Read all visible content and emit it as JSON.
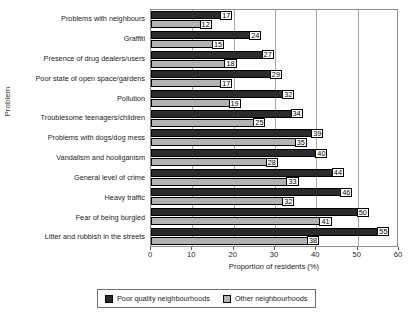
{
  "chart_data": {
    "type": "bar",
    "orientation": "horizontal",
    "title": "",
    "xlabel": "Proportion of residents (%)",
    "ylabel": "Problem",
    "xlim": [
      0,
      60
    ],
    "xticks": [
      0,
      10,
      20,
      30,
      40,
      50,
      60
    ],
    "grid": true,
    "grid_axis": "x",
    "legend_position": "bottom",
    "data_labels": true,
    "categories": [
      "Problems with neighbours",
      "Graffiti",
      "Presence of drug dealers/users",
      "Poor state of open space/gardens",
      "Pollution",
      "Troublesome teenagers/children",
      "Problems with dogs/dog mess",
      "Vandalism and hooliganism",
      "General level of crime",
      "Heavy traffic",
      "Fear of being burgled",
      "Litter and rubbish in the streets"
    ],
    "series": [
      {
        "name": "Poor quality neighbourhoods",
        "color": "#2b2b2b",
        "values": [
          17,
          24,
          27,
          29,
          32,
          34,
          39,
          40,
          44,
          46,
          50,
          55
        ]
      },
      {
        "name": "Other neighbourhoods",
        "color": "#b2b2b2",
        "values": [
          12,
          15,
          18,
          17,
          19,
          25,
          35,
          28,
          33,
          32,
          41,
          38
        ]
      }
    ]
  },
  "axes": {
    "x_title": "Proportion of residents (%)",
    "y_title": "Problem",
    "x_tick_labels": [
      "0",
      "10",
      "20",
      "30",
      "40",
      "50",
      "60"
    ]
  },
  "legend": {
    "entries": [
      {
        "label": "Poor quality neighbourhoods",
        "color": "#2b2b2b"
      },
      {
        "label": "Other neighbourhoods",
        "color": "#b2b2b2"
      }
    ]
  }
}
